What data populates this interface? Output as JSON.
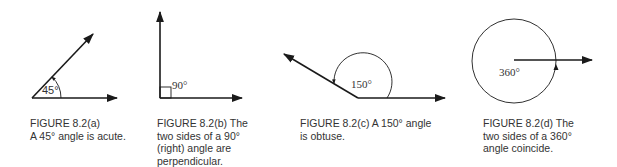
{
  "figures": [
    {
      "id": "a",
      "angle_label": "45°",
      "angle_degrees": 45,
      "caption": "FIGURE 8.2(a)\nA 45° angle is acute."
    },
    {
      "id": "b",
      "angle_label": "90°",
      "angle_degrees": 90,
      "caption": "FIGURE 8.2(b)    The\ntwo sides of a 90°\n(right) angle are\nperpendicular."
    },
    {
      "id": "c",
      "angle_label": "150°",
      "angle_degrees": 150,
      "caption": "FIGURE 8.2(c)    A 150° angle\nis obtuse."
    },
    {
      "id": "d",
      "angle_label": "360°",
      "angle_degrees": 360,
      "caption": "FIGURE 8.2(d)    The\ntwo sides of a 360°\nangle coincide."
    }
  ],
  "colors": {
    "line": "#1a1a1a",
    "text": "#333333",
    "background": "#ffffff"
  }
}
